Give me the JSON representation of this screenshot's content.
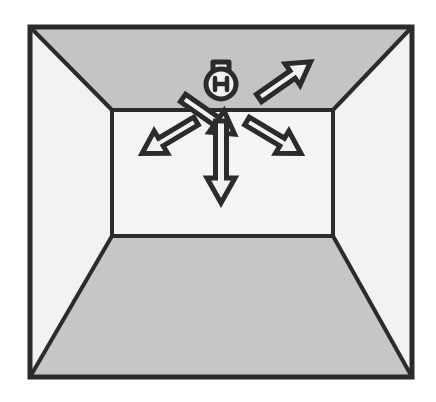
{
  "diagram": {
    "title": "Room interior light distribution",
    "type": "perspective-room-schematic",
    "caption": "",
    "colors": {
      "outline": "#2b2b2b",
      "ceiling_fill": "#c4c4c4",
      "floor_fill": "#c6c6c6",
      "left_wall_fill": "#f2f2f2",
      "right_wall_fill": "#f2f2f2",
      "back_wall_fill": "#f4f4f4",
      "page_background": "#ffffff",
      "arrow_fill": "#f2f2f2",
      "arrow_outline": "#2b2b2b",
      "lamp_fill": "#f2f2f2",
      "lamp_outline": "#2b2b2b"
    },
    "geometry": {
      "outer_frame": {
        "x": 30,
        "y": 27,
        "width": 382,
        "height": 350
      },
      "back_wall": {
        "x": 112,
        "y": 110,
        "width": 221,
        "height": 126
      },
      "stroke_width_outer": 5,
      "stroke_width_inner": 4
    },
    "surfaces": [
      {
        "id": "ceiling",
        "label": "Ceiling",
        "shade": "dark"
      },
      {
        "id": "left-wall",
        "label": "Left wall",
        "shade": "light"
      },
      {
        "id": "right-wall",
        "label": "Right wall",
        "shade": "light"
      },
      {
        "id": "back-wall",
        "label": "Back wall",
        "shade": "light"
      },
      {
        "id": "floor",
        "label": "Floor",
        "shade": "dark"
      }
    ],
    "lamp": {
      "id": "ceiling-lamp",
      "label": "Ceiling-mounted light bulb",
      "position": {
        "x": 221,
        "y": 80
      },
      "bulb_radius": 15,
      "filament_symbol": "H"
    },
    "arrows": [
      {
        "id": "arrow-up-left",
        "label": "Light beam up-left",
        "direction": "up-left",
        "angle_deg": 208,
        "surface": "ceiling",
        "tail": {
          "x": 183,
          "y": 98
        },
        "tip": {
          "x": 122,
          "y": 56
        },
        "shaft_width": 9,
        "head_width": 27,
        "head_length": 26
      },
      {
        "id": "arrow-up-right",
        "label": "Light beam up-right",
        "direction": "up-right",
        "angle_deg": 332,
        "surface": "ceiling",
        "tail": {
          "x": 259,
          "y": 98
        },
        "tip": {
          "x": 320,
          "y": 56
        },
        "shaft_width": 9,
        "head_width": 27,
        "head_length": 26
      },
      {
        "id": "arrow-down-left",
        "label": "Light beam down-left",
        "direction": "down-left",
        "angle_deg": 152,
        "surface": "back-wall",
        "tail": {
          "x": 196,
          "y": 121
        },
        "tip": {
          "x": 131,
          "y": 160
        },
        "shaft_width": 9,
        "head_width": 27,
        "head_length": 26
      },
      {
        "id": "arrow-down-right",
        "label": "Light beam down-right",
        "direction": "down-right",
        "angle_deg": 28,
        "surface": "back-wall",
        "tail": {
          "x": 247,
          "y": 121
        },
        "tip": {
          "x": 312,
          "y": 160
        },
        "shaft_width": 9,
        "head_width": 27,
        "head_length": 26
      },
      {
        "id": "arrow-down",
        "label": "Light beam straight down",
        "direction": "down",
        "angle_deg": 90,
        "surface": "back-wall",
        "tail": {
          "x": 221,
          "y": 121
        },
        "tip": {
          "x": 221,
          "y": 203
        },
        "shaft_width": 11,
        "head_width": 30,
        "head_length": 26
      }
    ]
  }
}
